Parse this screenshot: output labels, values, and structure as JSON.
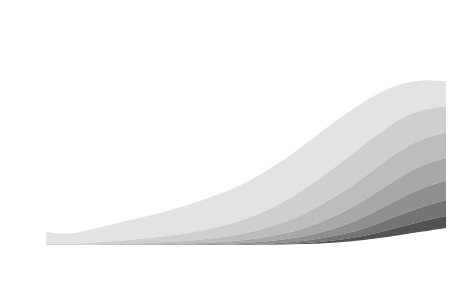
{
  "chart_data": {
    "type": "area",
    "title": "",
    "xlabel": "Age group (years)",
    "ylabel": "Patients (%)",
    "ylim": [
      0,
      100
    ],
    "ytick_step": 10,
    "yticks": [
      0,
      10,
      20,
      30,
      40,
      50,
      60,
      70,
      80,
      90,
      100
    ],
    "grid": false,
    "stacked": true,
    "stack_order": "bottom-to-top-is-highest-count",
    "legend_position": "top-left inside plot",
    "categories": [
      "0-4",
      "5-9",
      "10-14",
      "15-19",
      "20-24",
      "25-29",
      "30-34",
      "35-39",
      "40-44",
      "45-49",
      "50-54",
      "55-59",
      "60-64",
      "65-69",
      "70-74",
      "75-79",
      "80-84",
      "85+"
    ],
    "series": [
      {
        "name": "0 disorders",
        "color": "#ffffff",
        "values": [
          94.3,
          95.0,
          93.0,
          90.5,
          88.0,
          85.5,
          82.5,
          79.0,
          75.0,
          70.0,
          63.5,
          55.0,
          45.0,
          35.0,
          25.5,
          17.0,
          11.0,
          7.0
        ]
      },
      {
        "name": "1 disorder",
        "color": "#e3e3e3",
        "values": [
          5.2,
          4.5,
          6.0,
          7.8,
          9.3,
          10.8,
          12.3,
          13.8,
          15.2,
          16.8,
          18.3,
          19.5,
          20.0,
          19.5,
          18.0,
          15.5,
          13.0,
          11.0
        ]
      },
      {
        "name": "2 disorders",
        "color": "#cfcfcf",
        "values": [
          0.4,
          0.4,
          0.8,
          1.3,
          1.9,
          2.5,
          3.3,
          4.3,
          5.5,
          7.0,
          8.8,
          10.8,
          12.5,
          13.8,
          14.2,
          13.8,
          12.8,
          11.5
        ]
      },
      {
        "name": "3 disorders",
        "color": "#bdbdbd",
        "values": [
          0.1,
          0.1,
          0.2,
          0.3,
          0.5,
          0.8,
          1.2,
          1.8,
          2.5,
          3.5,
          4.8,
          6.3,
          8.0,
          9.5,
          10.8,
          11.5,
          11.5,
          11.0
        ]
      },
      {
        "name": "4 disorders",
        "color": "#a8a8a8",
        "values": [
          0.0,
          0.0,
          0.0,
          0.1,
          0.2,
          0.3,
          0.4,
          0.7,
          1.1,
          1.7,
          2.5,
          3.6,
          5.0,
          6.5,
          8.0,
          9.3,
          10.0,
          10.0
        ]
      },
      {
        "name": "5 disorders",
        "color": "#8f8f8f",
        "values": [
          0.0,
          0.0,
          0.0,
          0.0,
          0.1,
          0.1,
          0.2,
          0.3,
          0.5,
          0.8,
          1.3,
          2.0,
          3.0,
          4.3,
          5.8,
          7.2,
          8.2,
          8.6
        ]
      },
      {
        "name": "6 disorders",
        "color": "#747474",
        "values": [
          0.0,
          0.0,
          0.0,
          0.0,
          0.0,
          0.0,
          0.1,
          0.1,
          0.2,
          0.3,
          0.6,
          1.0,
          1.7,
          2.6,
          3.8,
          5.2,
          6.3,
          7.0
        ]
      },
      {
        "name": "7 disorders",
        "color": "#525252",
        "values": [
          0.0,
          0.0,
          0.0,
          0.0,
          0.0,
          0.0,
          0.0,
          0.0,
          0.0,
          0.1,
          0.2,
          0.5,
          0.9,
          1.5,
          2.4,
          3.5,
          4.5,
          5.2
        ]
      },
      {
        "name": "≥8 disorders",
        "color": "#232323",
        "values": [
          0.0,
          0.0,
          0.0,
          0.0,
          0.0,
          0.0,
          0.0,
          0.0,
          0.0,
          0.1,
          0.2,
          0.4,
          0.9,
          1.6,
          2.8,
          4.3,
          5.9,
          7.5
        ]
      }
    ],
    "cumulative_top_edges_at_85plus": [
      7.0,
      18.0,
      29.5,
      40.5,
      50.5,
      59.1,
      66.1,
      71.3,
      78.8
    ],
    "annotations": []
  },
  "legend": {
    "items": [
      {
        "label": "0 disorders",
        "color": "#ffffff"
      },
      {
        "label": "1 disorder",
        "color": "#e3e3e3"
      },
      {
        "label": "2 disorders",
        "color": "#cfcfcf"
      },
      {
        "label": "3 disorders",
        "color": "#bdbdbd"
      },
      {
        "label": "4 disorders",
        "color": "#a8a8a8"
      },
      {
        "label": "5 disorders",
        "color": "#8f8f8f"
      },
      {
        "label": "6 disorders",
        "color": "#747474"
      },
      {
        "label": "7 disorders",
        "color": "#525252"
      },
      {
        "label": "≥8 disorders",
        "color": "#232323"
      }
    ]
  },
  "colors": {
    "axis": "#1a1a1a",
    "band_edge": "#4a4a4a",
    "background": "#ffffff"
  }
}
